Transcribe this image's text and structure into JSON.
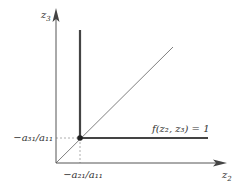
{
  "diagram": {
    "axes": {
      "vertical_label": "z",
      "vertical_sub": "3",
      "horizontal_label": "z",
      "horizontal_sub": "2"
    },
    "labels": {
      "y_tick": "−a₃₁/a₁₁",
      "x_tick": "−a₂₁/a₁₁",
      "curve": "f(z₂, z₃) = 1"
    },
    "colors": {
      "axis": "#555555",
      "thick_line": "#444444",
      "diagonal": "#777777",
      "dashed": "#888888",
      "dot": "#222222"
    }
  }
}
